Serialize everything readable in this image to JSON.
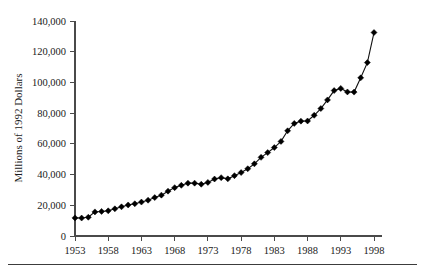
{
  "chart_data": {
    "type": "line",
    "title": "",
    "subtitle": "",
    "xlabel": "",
    "ylabel": "Millions of 1992 Dollars",
    "xlim": [
      1953,
      1998
    ],
    "ylim": [
      0,
      140000
    ],
    "grid": false,
    "legend": null,
    "marker": "diamond",
    "line_color": "#000000",
    "marker_color": "#000000",
    "axis_color": "#4a4a4a",
    "background_color": "#ffffff",
    "x_tick_labels": [
      "1953",
      "1958",
      "1963",
      "1968",
      "1973",
      "1978",
      "1983",
      "1988",
      "1993",
      "1998"
    ],
    "x_tick_values": [
      1953,
      1958,
      1963,
      1968,
      1973,
      1978,
      1983,
      1988,
      1993,
      1998
    ],
    "y_tick_labels": [
      "0",
      "20,000",
      "40,000",
      "60,000",
      "80,000",
      "100,000",
      "120,000",
      "140,000"
    ],
    "y_tick_values": [
      0,
      20000,
      40000,
      60000,
      80000,
      100000,
      120000,
      140000
    ],
    "x": [
      1953,
      1954,
      1955,
      1956,
      1957,
      1958,
      1959,
      1960,
      1961,
      1962,
      1963,
      1964,
      1965,
      1966,
      1967,
      1968,
      1969,
      1970,
      1971,
      1972,
      1973,
      1974,
      1975,
      1976,
      1977,
      1978,
      1979,
      1980,
      1981,
      1982,
      1983,
      1984,
      1985,
      1986,
      1987,
      1988,
      1989,
      1990,
      1991,
      1992,
      1993,
      1994,
      1995,
      1996,
      1997,
      1998
    ],
    "values": [
      11800,
      11700,
      12200,
      15700,
      16000,
      16400,
      17700,
      19000,
      20200,
      21000,
      22100,
      23300,
      25000,
      26600,
      29200,
      31500,
      33000,
      34400,
      34400,
      33700,
      34900,
      37100,
      38000,
      37200,
      39300,
      41300,
      43800,
      47000,
      51200,
      54300,
      57600,
      61600,
      68500,
      73300,
      74800,
      74900,
      78600,
      83000,
      88600,
      94700,
      96100,
      93800,
      93700,
      103000,
      112900,
      132500
    ],
    "series": [
      {
        "name": "Millions of 1992 Dollars",
        "values": [
          11800,
          11700,
          12200,
          15700,
          16000,
          16400,
          17700,
          19000,
          20200,
          21000,
          22100,
          23300,
          25000,
          26600,
          29200,
          31500,
          33000,
          34400,
          34400,
          33700,
          34900,
          37100,
          38000,
          37200,
          39300,
          41300,
          43800,
          47000,
          51200,
          54300,
          57600,
          61600,
          68500,
          73300,
          74800,
          74900,
          78600,
          83000,
          88600,
          94700,
          96100,
          93800,
          93700,
          103000,
          112900,
          132500
        ]
      }
    ]
  },
  "figure": {
    "bottom_rule": true
  }
}
